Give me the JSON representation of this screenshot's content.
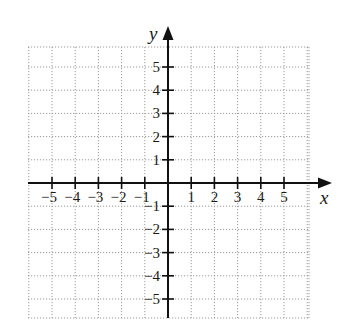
{
  "chart_data": {
    "type": "scatter",
    "title": "",
    "xlabel": "x",
    "ylabel": "y",
    "xlim": [
      -6,
      6
    ],
    "ylim": [
      -6,
      6
    ],
    "grid": true,
    "grid_style": "dotted",
    "x_ticks": [
      -5,
      -4,
      -3,
      -2,
      -1,
      1,
      2,
      3,
      4,
      5
    ],
    "y_ticks": [
      -5,
      -4,
      -3,
      -2,
      -1,
      1,
      2,
      3,
      4,
      5
    ],
    "x_tick_labels": [
      "−5",
      "−4",
      "−3",
      "−2",
      "−1",
      "1",
      "2",
      "3",
      "4",
      "5"
    ],
    "y_tick_labels": [
      "−5",
      "−4",
      "−3",
      "−2",
      "−1",
      "1",
      "2",
      "3",
      "4",
      "5"
    ],
    "series": [],
    "legend": null
  },
  "colors": {
    "axis": "#111111",
    "grid": "#9a9a9a",
    "background": "#ffffff"
  }
}
